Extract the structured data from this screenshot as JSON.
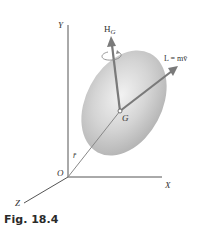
{
  "figure": {
    "caption": "Fig. 18.4",
    "axes": {
      "x_label": "X",
      "y_label": "Y",
      "z_label": "Z",
      "origin_label": "O"
    },
    "labels": {
      "center_of_mass": "G",
      "position_vector": "r̄",
      "angular_momentum_main": "H",
      "angular_momentum_sub": "G",
      "linear_momentum": "L = mv̄"
    },
    "colors": {
      "axis": "#555555",
      "vector": "#7a7a7a",
      "body_fill": "#c8c8c8",
      "text": "#333333"
    }
  }
}
